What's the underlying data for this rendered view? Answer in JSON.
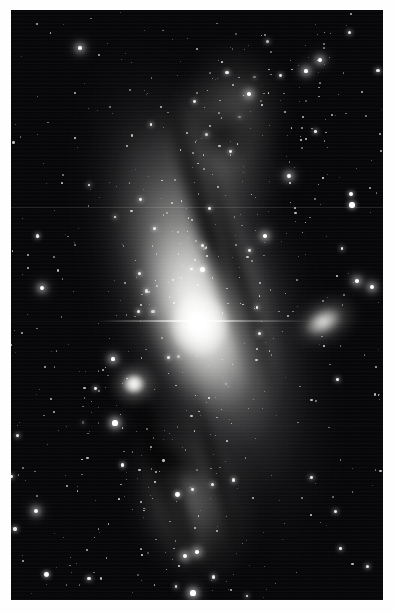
{
  "image": {
    "kind": "astrophotograph",
    "subject": "Andromeda Galaxy (M31) with companions",
    "rendering": "grayscale",
    "plate": {
      "left": 11,
      "top": 10,
      "width": 372,
      "height": 590,
      "background_color": "#050507",
      "border_color": "#fefefe"
    }
  },
  "objects": {
    "primary_galaxy": {
      "name": "m31-andromeda-galaxy",
      "core_x": 186,
      "core_y": 312,
      "position_angle_deg": -18,
      "core_color": "#ffffff",
      "disc_color": "#bdbdb9"
    },
    "companions": [
      {
        "name": "m110-ngc205",
        "x": 314,
        "y": 312,
        "position_angle_deg": -28,
        "core_color": "#faf9f7"
      },
      {
        "name": "m32-ngc221",
        "x": 123,
        "y": 374,
        "position_angle_deg": 0,
        "core_color": "#ffffff"
      }
    ]
  },
  "features": {
    "dust_lanes": 7,
    "spiral_arm_patches": 4,
    "star_count": 420,
    "bright_stars": [
      {
        "x": 115,
        "y": 423,
        "r": 2.6
      },
      {
        "x": 185,
        "y": 556,
        "r": 2.4
      },
      {
        "x": 197,
        "y": 552,
        "r": 1.8
      },
      {
        "x": 42,
        "y": 288,
        "r": 2.2
      },
      {
        "x": 36,
        "y": 511,
        "r": 2.4
      },
      {
        "x": 320,
        "y": 60,
        "r": 2.3
      },
      {
        "x": 306,
        "y": 71,
        "r": 1.6
      },
      {
        "x": 289,
        "y": 176,
        "r": 2.0
      },
      {
        "x": 357,
        "y": 281,
        "r": 1.8
      },
      {
        "x": 372,
        "y": 287,
        "r": 1.9
      },
      {
        "x": 80,
        "y": 48,
        "r": 1.8
      },
      {
        "x": 193,
        "y": 593,
        "r": 2.6
      },
      {
        "x": 113,
        "y": 359,
        "r": 1.6
      },
      {
        "x": 249,
        "y": 94,
        "r": 1.8
      },
      {
        "x": 265,
        "y": 236,
        "r": 1.7
      }
    ]
  },
  "colors": {
    "background": "#050507",
    "border": "#fefefe",
    "star": "#ffffff",
    "galaxy_core": "#ffffff",
    "galaxy_halo": "#9a9a97",
    "dust": "#060608"
  }
}
